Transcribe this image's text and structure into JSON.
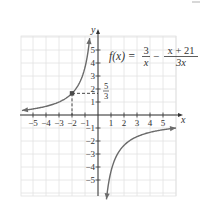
{
  "chart_data": {
    "type": "line",
    "title": "",
    "function_label": {
      "lhs": "f(x) =",
      "term1_num": "3",
      "term1_den": "x",
      "op": "−",
      "term2_num": "x + 21",
      "term2_den": "3x"
    },
    "expression": "f(x) = 3/x - (x + 21)/(3x)",
    "xlabel": "x",
    "ylabel": "y",
    "xlim": [
      -6,
      6
    ],
    "ylim": [
      -6,
      6
    ],
    "grid": true,
    "x_ticks": [
      -5,
      -4,
      -3,
      -2,
      -1,
      1,
      2,
      3,
      4,
      5
    ],
    "y_ticks": [
      5,
      4,
      3,
      2,
      1,
      -1,
      -2,
      -3,
      -4,
      -5
    ],
    "x_tick_labels": [
      "−5",
      "−4",
      "−3",
      "−2",
      "−1",
      "1",
      "2",
      "3",
      "4",
      "5"
    ],
    "y_tick_labels": [
      "5",
      "4",
      "3",
      "2",
      "1",
      "−1",
      "−2",
      "−3",
      "−4",
      "−5"
    ],
    "series": [
      {
        "name": "left branch",
        "domain": [
          -5.85,
          -0.64
        ],
        "points": [
          [
            -5.85,
            0.35
          ],
          [
            -5,
            0.47
          ],
          [
            -4,
            0.67
          ],
          [
            -3,
            1.0
          ],
          [
            -2,
            1.67
          ],
          [
            -1.5,
            2.33
          ],
          [
            -1,
            3.67
          ],
          [
            -0.8,
            4.67
          ],
          [
            -0.64,
            5.92
          ]
        ]
      },
      {
        "name": "right branch",
        "domain": [
          0.65,
          6.0
        ],
        "points": [
          [
            0.65,
            -6.49
          ],
          [
            0.8,
            -5.33
          ],
          [
            1,
            -4.33
          ],
          [
            1.5,
            -3.0
          ],
          [
            2,
            -2.33
          ],
          [
            3,
            -1.67
          ],
          [
            4,
            -1.33
          ],
          [
            5,
            -1.13
          ],
          [
            6,
            -1.0
          ]
        ]
      }
    ],
    "annotations": [
      {
        "type": "point",
        "x": -2,
        "y": 1.6667,
        "label_y": "5/3",
        "dashed_guides": true
      }
    ],
    "asymptotes": {
      "vertical": 0,
      "horizontal": -0.3333
    },
    "colors": {
      "curve": "#6b6b6b",
      "axis": "#333333",
      "grid": "#e2e2e2",
      "text": "#333333",
      "point": "#4a4a4a"
    }
  }
}
